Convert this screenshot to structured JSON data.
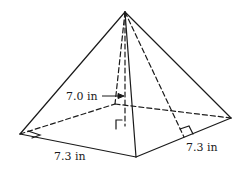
{
  "diagram": {
    "type": "square pyramid",
    "labels": {
      "height": "7.0 in",
      "base_front": "7.3 in",
      "base_right": "7.3 in"
    },
    "colors": {
      "line": "#1a1a1a",
      "background": "#ffffff"
    }
  }
}
